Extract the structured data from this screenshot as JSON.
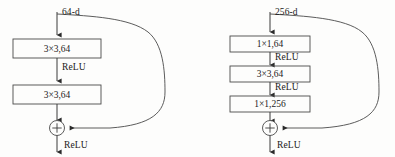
{
  "figure": {
    "type": "diagram",
    "background_color": "#fdfdfc",
    "stroke_color": "#3a3a3a",
    "text_color": "#1a1a1a"
  },
  "blocks": [
    {
      "id": "basic-block",
      "input_label": "64-d",
      "output_label": "ReLU",
      "sum_symbol": "+",
      "layers": [
        {
          "label": "3×3,64"
        },
        {
          "label": "3×3,64"
        }
      ],
      "activations": [
        {
          "label": "ReLU"
        }
      ]
    },
    {
      "id": "bottleneck-block",
      "input_label": "256-d",
      "output_label": "ReLU",
      "sum_symbol": "+",
      "layers": [
        {
          "label": "1×1,64"
        },
        {
          "label": "3×3,64"
        },
        {
          "label": "1×1,256"
        }
      ],
      "activations": [
        {
          "label": "ReLU"
        },
        {
          "label": "ReLU"
        }
      ]
    }
  ]
}
